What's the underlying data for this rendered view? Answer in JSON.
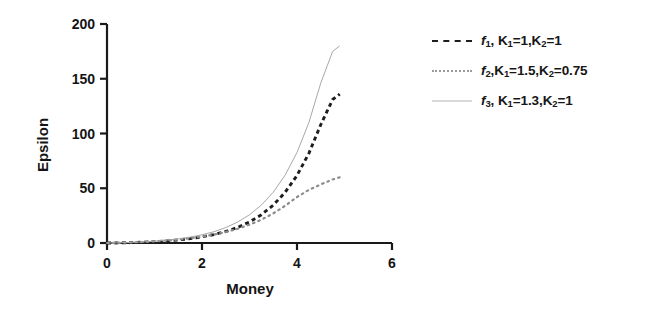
{
  "chart_data": {
    "type": "line",
    "title": "",
    "xlabel": "Money",
    "ylabel": "Epsilon",
    "xlim": [
      0,
      6
    ],
    "ylim": [
      0,
      200
    ],
    "xticks": [
      0,
      2,
      4,
      6
    ],
    "yticks": [
      0,
      50,
      100,
      150,
      200
    ],
    "xtick_labels": [
      "0",
      "2",
      "4",
      "6"
    ],
    "ytick_labels": [
      "0",
      "50",
      "100",
      "150",
      "200"
    ],
    "grid": false,
    "legend_position": "right",
    "series": [
      {
        "name": "f1, K1=1, K2=1",
        "style": "dashed",
        "color": "#1d1d1d",
        "x": [
          0,
          0.25,
          0.5,
          0.75,
          1.0,
          1.25,
          1.5,
          1.75,
          2.0,
          2.25,
          2.5,
          2.75,
          3.0,
          3.25,
          3.5,
          3.75,
          4.0,
          4.25,
          4.5,
          4.75,
          4.9
        ],
        "y": [
          0,
          0.1,
          0.3,
          0.7,
          1.2,
          1.9,
          2.8,
          4.0,
          5.6,
          7.7,
          10.5,
          14.2,
          19.2,
          25.8,
          34.6,
          46.3,
          61.7,
          81.9,
          108.0,
          131.0,
          136.0
        ]
      },
      {
        "name": "f2, K1=1.5, K2=0.75",
        "style": "dotted",
        "color": "#8c8c8c",
        "x": [
          0,
          0.25,
          0.5,
          0.75,
          1.0,
          1.25,
          1.5,
          1.75,
          2.0,
          2.25,
          2.5,
          2.75,
          3.0,
          3.25,
          3.5,
          3.75,
          4.0,
          4.25,
          4.5,
          4.75,
          4.9
        ],
        "y": [
          0,
          0.2,
          0.5,
          0.9,
          1.5,
          2.2,
          3.1,
          4.3,
          5.8,
          7.7,
          10.0,
          13.0,
          16.7,
          21.3,
          27.0,
          34.0,
          42.0,
          48.5,
          53.5,
          58.0,
          60.0
        ]
      },
      {
        "name": "f3, K1=1.3, K2=1",
        "style": "solid",
        "color": "#a8a8a8",
        "x": [
          0,
          0.25,
          0.5,
          0.75,
          1.0,
          1.25,
          1.5,
          1.75,
          2.0,
          2.25,
          2.5,
          2.75,
          3.0,
          3.25,
          3.5,
          3.75,
          4.0,
          4.25,
          4.5,
          4.75,
          4.9
        ],
        "y": [
          0,
          0.2,
          0.5,
          1.0,
          1.7,
          2.6,
          3.8,
          5.4,
          7.5,
          10.3,
          14.1,
          19.1,
          25.8,
          34.6,
          46.4,
          62.0,
          82.7,
          110.0,
          146.0,
          175.0,
          180.0
        ]
      }
    ],
    "legend_entries": [
      {
        "fn": "f",
        "fn_sub": "1",
        "rest": ", K",
        "k1_sub": "1",
        "k1_val": "=1,K",
        "k2_sub": "2",
        "k2_val": "=1",
        "full_text": "f1, K1=1,K2=1",
        "style": "dashed"
      },
      {
        "fn": "f",
        "fn_sub": "2",
        "rest": ",K",
        "k1_sub": "1",
        "k1_val": "=1.5,K",
        "k2_sub": "2",
        "k2_val": "=0.75",
        "full_text": "f2,K1=1.5,K2=0.75",
        "style": "dotted"
      },
      {
        "fn": "f",
        "fn_sub": "3",
        "rest": ", K",
        "k1_sub": "1",
        "k1_val": "=1.3,K",
        "k2_sub": "2",
        "k2_val": "=1",
        "full_text": "f3, K1=1.3,K2=1",
        "style": "solid"
      }
    ]
  }
}
